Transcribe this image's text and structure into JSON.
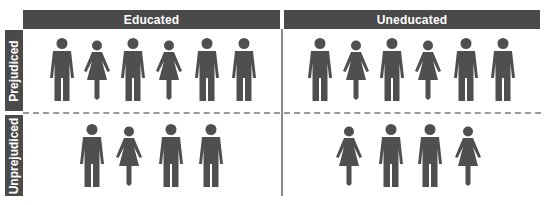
{
  "columns": [
    {
      "label": "Educated"
    },
    {
      "label": "Uneducated"
    }
  ],
  "rows": [
    {
      "label": "Prejudiced"
    },
    {
      "label": "Unprejudiced"
    }
  ],
  "figure_color": "#4f4f4f",
  "header_color": "#4a4a4a",
  "cells": {
    "educated_prejudiced": [
      "man",
      "woman",
      "man",
      "woman",
      "man",
      "man"
    ],
    "uneducated_prejudiced": [
      "man",
      "woman",
      "man",
      "woman",
      "man",
      "man"
    ],
    "educated_unprejudiced": [
      "man",
      "woman",
      "man",
      "man"
    ],
    "uneducated_unprejudiced": [
      "woman",
      "man",
      "man",
      "woman"
    ]
  },
  "chart_data": {
    "type": "table",
    "title": "",
    "columns": [
      "Educated",
      "Uneducated"
    ],
    "rows": [
      "Prejudiced",
      "Unprejudiced"
    ],
    "values": [
      [
        6,
        6
      ],
      [
        4,
        4
      ]
    ],
    "composition": {
      "Educated/Prejudiced": {
        "men": 4,
        "women": 2
      },
      "Uneducated/Prejudiced": {
        "men": 4,
        "women": 2
      },
      "Educated/Unprejudiced": {
        "men": 3,
        "women": 1
      },
      "Uneducated/Unprejudiced": {
        "men": 2,
        "women": 2
      }
    }
  }
}
